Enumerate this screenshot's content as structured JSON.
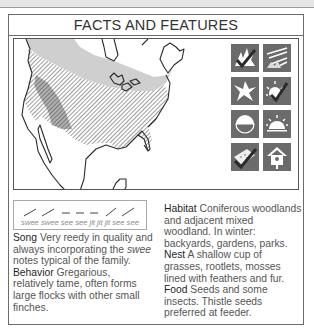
{
  "page": {
    "title": "FACTS AND FEATURES"
  },
  "map": {
    "description": "Range map of North America",
    "legend_hint": {
      "hatched": "year-round range",
      "light_gray": "breeding range",
      "dark_gray": "winter range"
    },
    "colors": {
      "breeding": "#cfcfcf",
      "winter_band": "#9c9c9c",
      "hatch": "#6a6a6a",
      "outline": "#2a2a2a"
    }
  },
  "icons": [
    {
      "name": "coniferous-habitat-icon",
      "label": "Coniferous woodland"
    },
    {
      "name": "field-habitat-icon",
      "label": "Open field / scrub"
    },
    {
      "name": "flight-pattern-icon",
      "label": "Undulating flight"
    },
    {
      "name": "diurnal-sun-icon",
      "label": "Active by day"
    },
    {
      "name": "half-moon-icon",
      "label": "Seasonal presence"
    },
    {
      "name": "sunrise-icon",
      "label": "Dawn activity"
    },
    {
      "name": "feeder-tray-icon",
      "label": "Visits feeder tray"
    },
    {
      "name": "birdhouse-icon",
      "label": "Uses nest box"
    }
  ],
  "song_diagram": {
    "notes": "swee swee see see jit jit jit see see"
  },
  "sections": {
    "song": {
      "label": "Song",
      "text_before": " Very reedy in quality and always incorporating the ",
      "italic": "swee",
      "text_after": " notes typical of the family."
    },
    "behavior": {
      "label": "Behavior",
      "text": " Gregarious, relatively tame, often forms large flocks with other small finches."
    },
    "habitat": {
      "label": "Habitat",
      "text": " Coniferous woodlands and adjacent mixed woodland. In winter: backyards, gardens, parks."
    },
    "nest": {
      "label": "Nest",
      "text": " A shallow cup of grasses, rootlets, mosses lined with feathers and fur."
    },
    "food": {
      "label": "Food",
      "text": " Seeds and some insects. Thistle seeds preferred at feeder."
    }
  }
}
